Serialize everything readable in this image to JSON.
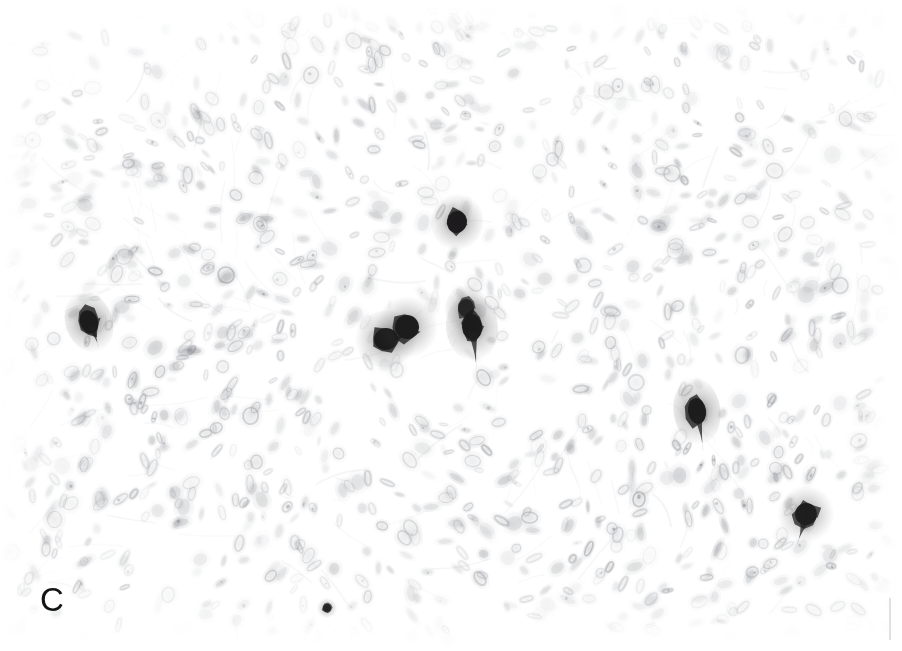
{
  "figure": {
    "domain": "Natural-Image",
    "kind": "photomicrograph",
    "panel_label": "C",
    "modality": "immunohistochemistry",
    "background_color": "#ffffff",
    "nuclei_color": "#b9bcc2",
    "nuclei_color_dark": "#8b8f96",
    "positive_cell_color": "#1d1d1f",
    "label_color": "#141414",
    "edge_artifact_color": "#c9c9c9"
  },
  "field": {
    "x": 0,
    "y": 0,
    "width": 902,
    "height": 651,
    "tissue_top": 18,
    "tissue_left": 12,
    "tissue_right": 884,
    "tissue_bottom": 628,
    "nuclei_count": 1450,
    "seed": 20240917
  },
  "positive_cells": [
    {
      "name": "positive-cell-1",
      "x": 89,
      "y": 322,
      "rx": 9,
      "ry": 12,
      "rot": -20,
      "opacity": 0.94,
      "tail": 16
    },
    {
      "name": "positive-cell-2",
      "x": 457,
      "y": 222,
      "rx": 10,
      "ry": 11,
      "rot": 12,
      "opacity": 0.95,
      "tail": 0
    },
    {
      "name": "positive-cell-3",
      "x": 386,
      "y": 339,
      "rx": 12,
      "ry": 11,
      "rot": -12,
      "opacity": 0.96,
      "tail": 0
    },
    {
      "name": "positive-cell-4",
      "x": 407,
      "y": 327,
      "rx": 12,
      "ry": 12,
      "rot": 20,
      "opacity": 0.94,
      "tail": 0
    },
    {
      "name": "positive-cell-5",
      "x": 466,
      "y": 308,
      "rx": 8,
      "ry": 9,
      "rot": 5,
      "opacity": 0.85,
      "tail": 0
    },
    {
      "name": "positive-cell-6",
      "x": 472,
      "y": 327,
      "rx": 10,
      "ry": 13,
      "rot": -5,
      "opacity": 0.95,
      "tail": 34
    },
    {
      "name": "positive-cell-7",
      "x": 697,
      "y": 411,
      "rx": 9,
      "ry": 13,
      "rot": -8,
      "opacity": 0.93,
      "tail": 30
    },
    {
      "name": "positive-cell-8",
      "x": 806,
      "y": 514,
      "rx": 11,
      "ry": 11,
      "rot": 18,
      "opacity": 0.9,
      "tail": 22
    },
    {
      "name": "positive-cell-9",
      "x": 327,
      "y": 608,
      "rx": 4,
      "ry": 4,
      "rot": 0,
      "opacity": 0.8,
      "tail": 0
    }
  ]
}
